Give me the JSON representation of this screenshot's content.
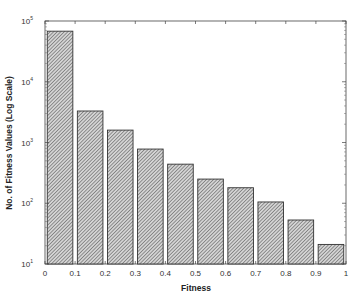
{
  "chart_data": {
    "type": "bar",
    "title": "",
    "xlabel": "Fitness",
    "ylabel": "No. of Fitness Values (Log Scale)",
    "yscale": "log",
    "ylim": [
      10,
      100000
    ],
    "xlim": [
      0,
      1
    ],
    "grid": false,
    "legend": null,
    "categories": [
      "0-0.1",
      "0.1-0.2",
      "0.2-0.3",
      "0.3-0.4",
      "0.4-0.5",
      "0.5-0.6",
      "0.6-0.7",
      "0.7-0.8",
      "0.8-0.9",
      "0.9-1.0"
    ],
    "bin_centers": [
      0.05,
      0.15,
      0.25,
      0.35,
      0.45,
      0.55,
      0.65,
      0.75,
      0.85,
      0.95
    ],
    "values": [
      68000,
      3300,
      1600,
      780,
      440,
      250,
      180,
      105,
      53,
      21
    ],
    "x_ticks": [
      "0",
      "0.1",
      "0.2",
      "0.3",
      "0.4",
      "0.5",
      "0.6",
      "0.7",
      "0.8",
      "0.9",
      "1"
    ],
    "y_ticks": [
      {
        "base": "10",
        "exp": "1"
      },
      {
        "base": "10",
        "exp": "2"
      },
      {
        "base": "10",
        "exp": "3"
      },
      {
        "base": "10",
        "exp": "4"
      },
      {
        "base": "10",
        "exp": "5"
      }
    ],
    "bar_fill": "hatched-gray",
    "bar_color": "#a8a8a8",
    "edge_color": "#333333"
  }
}
